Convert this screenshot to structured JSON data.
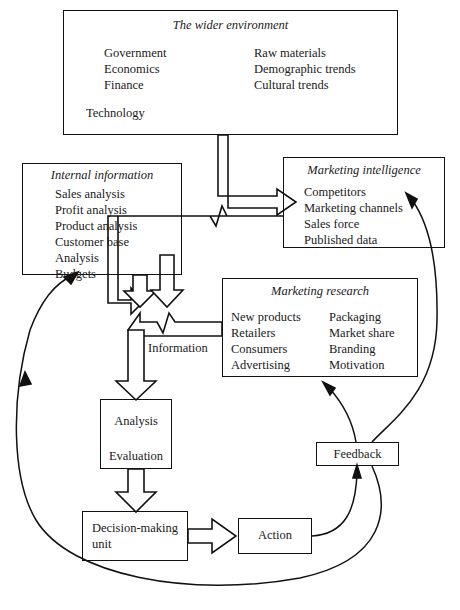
{
  "diagram": {
    "type": "flow-diagram",
    "line_color": "#111111",
    "background": "#ffffff"
  },
  "boxes": {
    "wider_environment": {
      "title": "The wider environment",
      "left_items": [
        "Government",
        "Economics",
        "Finance"
      ],
      "right_items": [
        "Raw materials",
        "Demographic trends",
        "Cultural trends"
      ],
      "bottom_item": "Technology"
    },
    "internal_information": {
      "title": "Internal information",
      "items": [
        "Sales analysis",
        "Profit analysis",
        "Product analysis",
        "Customer base",
        "Analysis",
        "Budgets"
      ]
    },
    "marketing_intelligence": {
      "title": "Marketing intelligence",
      "items": [
        "Competitors",
        "Marketing channels",
        "Sales force",
        "Published data"
      ]
    },
    "marketing_research": {
      "title": "Marketing research",
      "left_items": [
        "New products",
        "Retailers",
        "Consumers",
        "Advertising"
      ],
      "right_items": [
        "Packaging",
        "Market share",
        "Branding",
        "Motivation"
      ]
    },
    "analysis_evaluation": {
      "line1": "Analysis",
      "line2": "Evaluation"
    },
    "decision_making_unit": {
      "line1": "Decision-making",
      "line2": "unit"
    },
    "action": {
      "label": "Action"
    },
    "feedback": {
      "label": "Feedback"
    }
  },
  "labels": {
    "information": "Information"
  },
  "connectors": [
    {
      "name": "wider-environment-to-marketing-intelligence",
      "style": "hollow-arrow",
      "from": "wider_environment",
      "to": "marketing_intelligence"
    },
    {
      "name": "wider-environment-to-information-channel",
      "style": "hollow-arrow",
      "from": "wider_environment",
      "to": "information_channel"
    },
    {
      "name": "marketing-intelligence-to-information-channel",
      "style": "hollow-arrow",
      "from": "marketing_intelligence",
      "to": "information_channel"
    },
    {
      "name": "internal-information-to-information-channel",
      "style": "hollow-arrow",
      "from": "internal_information",
      "to": "information_channel"
    },
    {
      "name": "marketing-research-to-information-channel",
      "style": "hollow-arrow",
      "from": "marketing_research",
      "to": "information_channel"
    },
    {
      "name": "information-channel-to-analysis",
      "style": "hollow-arrow",
      "from": "information_channel",
      "to": "analysis_evaluation"
    },
    {
      "name": "analysis-to-decision-making-unit",
      "style": "hollow-arrow",
      "from": "analysis_evaluation",
      "to": "decision_making_unit"
    },
    {
      "name": "decision-making-unit-to-action",
      "style": "hollow-arrow",
      "from": "decision_making_unit",
      "to": "action"
    },
    {
      "name": "action-to-feedback",
      "style": "curved-arrow",
      "from": "action",
      "to": "feedback"
    },
    {
      "name": "feedback-to-marketing-research",
      "style": "curved-arrow",
      "from": "feedback",
      "to": "marketing_research"
    },
    {
      "name": "feedback-to-marketing-intelligence",
      "style": "curved-arrow",
      "from": "feedback",
      "to": "marketing_intelligence"
    },
    {
      "name": "feedback-to-internal-information",
      "style": "curved-arrow",
      "from": "feedback",
      "to": "internal_information"
    }
  ]
}
